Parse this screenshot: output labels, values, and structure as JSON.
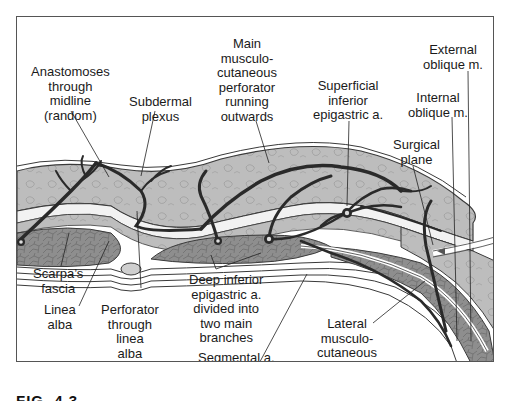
{
  "figure": {
    "caption": "FIG. 4.3",
    "caption_visibility": "cropped at bottom edge, text not confirmed"
  },
  "labels": {
    "anastomoses": [
      "Anastomoses",
      "through",
      "midline",
      "(random)"
    ],
    "subdermal": [
      "Subdermal",
      "plexus"
    ],
    "main_perforator": [
      "Main",
      "musculo-",
      "cutaneous",
      "perforator",
      "running",
      "outwards"
    ],
    "superficial_epigastric": [
      "Superficial",
      "inferior",
      "epigastric a."
    ],
    "external_oblique": [
      "External",
      "oblique m."
    ],
    "internal_oblique": [
      "Internal",
      "oblique m."
    ],
    "surgical_plane": [
      "Surgical",
      "plane"
    ],
    "scarpas_fascia": [
      "Scarpa’s",
      "fascia"
    ],
    "linea_alba": [
      "Linea",
      "alba"
    ],
    "perforator_linea_alba": [
      "Perforator",
      "through",
      "linea",
      "alba"
    ],
    "deep_epigastric": [
      "Deep inferior",
      "epigastric a.",
      "divided into",
      "two main",
      "branches"
    ],
    "segmental": [
      "Segmental a."
    ],
    "lateral_perforator": [
      "Lateral",
      "musculo-",
      "cutaneous",
      "perforator"
    ]
  },
  "colors": {
    "fat": "#bdbdbd",
    "muscle": "#8e8e8e",
    "fascia": "#f2f2f2",
    "vessel": "#2a2a2a",
    "outline": "#3a3a3a"
  }
}
